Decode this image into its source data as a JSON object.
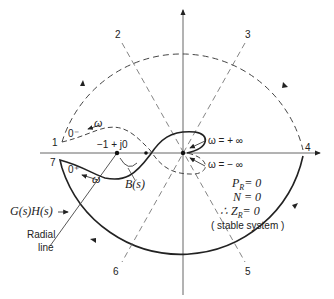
{
  "diagram": {
    "type": "nyquist-plot",
    "point_labels": [
      "1",
      "2",
      "3",
      "4",
      "5",
      "6",
      "7"
    ],
    "critical_point": "−1 + j0",
    "omega_plus_inf": "ω = + ∞",
    "omega_minus_inf": "ω = − ∞",
    "zero_minus": "0⁻",
    "zero_plus": "0⁺",
    "omega": "ω",
    "b_label": "B(s)",
    "gh_label": "G(s)H(s)",
    "radial_line": [
      "Radial",
      "line"
    ],
    "conclusion": {
      "pr": "P",
      "pr_sub": "R",
      "pr_val": "= 0",
      "n": "N = 0",
      "therefore": "∴ Z",
      "zr_sub": "R",
      "zr_val": "= 0",
      "stable": "( stable system )"
    },
    "colors": {
      "line": "#222222",
      "dashed": "#444444",
      "thin": "#666666"
    }
  }
}
